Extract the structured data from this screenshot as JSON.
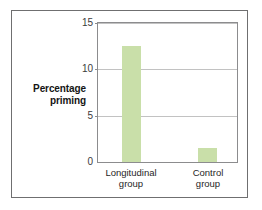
{
  "chart_data": {
    "type": "bar",
    "title": "",
    "subtitle": "",
    "xlabel": "",
    "ylabel": "Percentage priming",
    "categories": [
      "Longitudinal group",
      "Control group"
    ],
    "category_lines": [
      [
        "Longitudinal",
        "group"
      ],
      [
        "Control",
        "group"
      ]
    ],
    "values": [
      12.5,
      1.5
    ],
    "ylim": [
      0,
      15
    ],
    "yticks": [
      0,
      5,
      10,
      15
    ],
    "ytick_labels": [
      "0",
      "5",
      "10",
      "15"
    ],
    "grid": "horizontal",
    "legend": "none",
    "bar_color": "#c9dfa9",
    "gridline_color": "#c2c2c2",
    "axis_color": "#8c8c8e",
    "frame_color": "#6f6f70",
    "text_color": "#262626"
  },
  "axis_title": {
    "line1": "Percentage",
    "line2": "priming"
  }
}
